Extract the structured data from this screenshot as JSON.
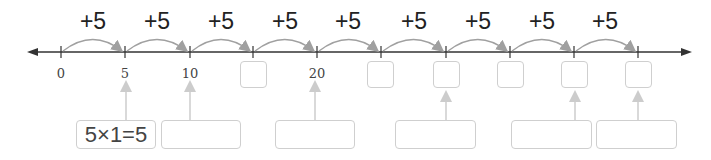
{
  "number_line": {
    "start_value": 0,
    "step": 5,
    "ticks": [
      {
        "value": "0",
        "shown": true
      },
      {
        "value": "5",
        "shown": true
      },
      {
        "value": "10",
        "shown": true
      },
      {
        "value": "",
        "shown": false
      },
      {
        "value": "20",
        "shown": true
      },
      {
        "value": "",
        "shown": false
      },
      {
        "value": "",
        "shown": false
      },
      {
        "value": "",
        "shown": false
      },
      {
        "value": "",
        "shown": false
      },
      {
        "value": "",
        "shown": false
      }
    ],
    "jumps": [
      "+5",
      "+5",
      "+5",
      "+5",
      "+5",
      "+5",
      "+5",
      "+5",
      "+5"
    ]
  },
  "equations": [
    {
      "text": "5×1=5"
    },
    {
      "text": ""
    },
    {
      "text": ""
    },
    {
      "text": ""
    },
    {
      "text": ""
    },
    {
      "text": ""
    }
  ],
  "colors": {
    "line": "#333333",
    "arc": "#a0a0a0",
    "box": "#cfcfcf",
    "pointer": "#cccccc"
  }
}
